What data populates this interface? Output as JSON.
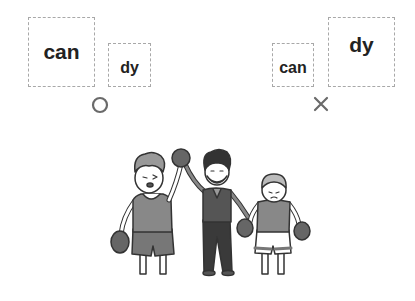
{
  "examples": [
    {
      "verdict": "correct",
      "verdict_symbol": "circle-icon",
      "parts": [
        {
          "text": "can",
          "size": "big"
        },
        {
          "text": "dy",
          "size": "small"
        }
      ]
    },
    {
      "verdict": "incorrect",
      "verdict_symbol": "cross-icon",
      "parts": [
        {
          "text": "can",
          "size": "small"
        },
        {
          "text": "dy",
          "size": "big"
        }
      ]
    }
  ],
  "illustration": {
    "description": "referee raising the winner boxer's arm while holding the loser's hand",
    "colors": {
      "line": "#333333",
      "dark": "#444444",
      "mid": "#777777",
      "light": "#bbbbbb",
      "skin": "#ffffff"
    }
  },
  "colors": {
    "mark": "#6a6a6a",
    "box_border": "#a8a8a8",
    "text": "#222222"
  }
}
